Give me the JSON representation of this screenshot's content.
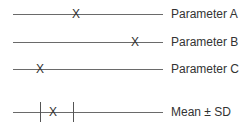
{
  "diagram": {
    "marker_glyph": "X",
    "rows": [
      {
        "label": "Parameter A",
        "marker_x": 76
      },
      {
        "label": "Parameter B",
        "marker_x": 135
      },
      {
        "label": "Parameter C",
        "marker_x": 40
      },
      {
        "label": "Mean ± SD",
        "marker_x": 53,
        "sd_low_x": 40,
        "sd_high_x": 73
      }
    ]
  }
}
